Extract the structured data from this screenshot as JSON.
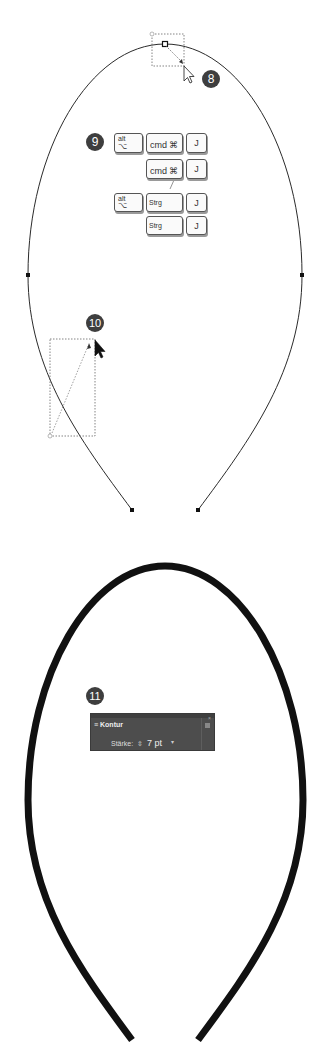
{
  "badges": {
    "step8": "8",
    "step9": "9",
    "step10": "10",
    "step11": "11"
  },
  "shortcuts": {
    "row1": {
      "mod1_top": "alt",
      "mod1_bottom": "⌥",
      "mod2": "cmd",
      "mod2_symbol": "⌘",
      "key": "J"
    },
    "row2": {
      "mod2": "cmd",
      "mod2_symbol": "⌘",
      "key": "J"
    },
    "separator": "/",
    "row3": {
      "mod1_top": "alt",
      "mod1_bottom": "⌥",
      "mod2": "Strg",
      "key": "J"
    },
    "row4": {
      "mod2": "Strg",
      "key": "J"
    }
  },
  "stroke_panel": {
    "title": "Kontur",
    "weight_label": "Stärke:",
    "weight_stepper": "⇳",
    "weight_value": "7 pt",
    "dropdown_arrow": "▾",
    "menu_icon": "panel-menu-icon",
    "close_icon": "×"
  },
  "colors": {
    "path_stroke": "#2b2b2b",
    "thick_stroke": "#111111",
    "badge_bg": "#3e3e3e",
    "panel_bg": "#4d4d4d"
  }
}
